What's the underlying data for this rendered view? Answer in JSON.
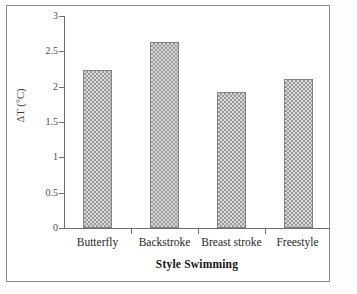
{
  "chart_data": {
    "type": "bar",
    "title": "",
    "xlabel": "Style Swimming",
    "ylabel": "ΔT (°C)",
    "categories": [
      "Butterfly",
      "Backstroke",
      "Breast stroke",
      "Freestyle"
    ],
    "values": [
      2.23,
      2.63,
      1.92,
      2.11
    ],
    "ylim": [
      0,
      3
    ],
    "yticks": [
      0,
      0.5,
      1,
      1.5,
      2,
      2.5,
      3
    ],
    "ytick_labels": [
      "0",
      "0.5",
      "1",
      "1.5",
      "2",
      "2.5",
      "3"
    ],
    "grid": false,
    "legend": null,
    "bar_fill": "#d9d9d9",
    "bar_pattern_color": "#9a9a9a",
    "bar_border": "#808080",
    "axis_color": "#6f6f6f"
  },
  "figure": {
    "frame_border_color": "#8d8d8d",
    "background": "#ffffff",
    "scan_caption": ""
  }
}
